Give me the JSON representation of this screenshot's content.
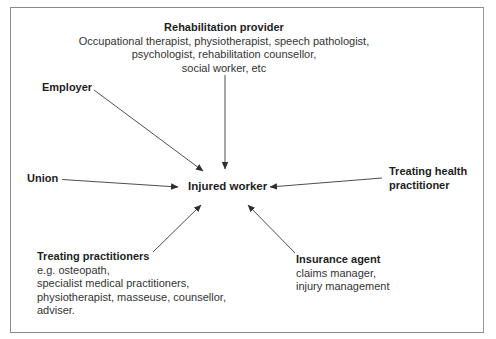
{
  "diagram": {
    "type": "hub-and-spoke",
    "center": {
      "title": "Injured worker"
    },
    "nodes": {
      "rehab": {
        "title": "Rehabilitation provider",
        "lines": [
          "Occupational therapist, physiotherapist, speech pathologist,",
          "psychologist, rehabilitation counsellor,",
          "social worker, etc"
        ]
      },
      "employer": {
        "title": "Employer"
      },
      "union": {
        "title": "Union"
      },
      "health": {
        "title_lines": [
          "Treating health",
          "practitioner"
        ]
      },
      "treating": {
        "title": "Treating practitioners",
        "lines": [
          "e.g. osteopath,",
          "specialist medical practitioners,",
          "physiotherapist, masseuse, counsellor,",
          "adviser."
        ]
      },
      "insurance": {
        "title": "Insurance agent",
        "lines": [
          "claims manager,",
          "injury management"
        ]
      }
    },
    "edges": [
      {
        "from": "Rehabilitation provider",
        "to": "Injured worker"
      },
      {
        "from": "Employer",
        "to": "Injured worker"
      },
      {
        "from": "Union",
        "to": "Injured worker"
      },
      {
        "from": "Treating health practitioner",
        "to": "Injured worker"
      },
      {
        "from": "Treating practitioners",
        "to": "Injured worker"
      },
      {
        "from": "Insurance agent",
        "to": "Injured worker"
      }
    ],
    "colors": {
      "line": "#3a3a3a",
      "text": "#2a2a2a",
      "border": "#8a8a8a"
    }
  }
}
